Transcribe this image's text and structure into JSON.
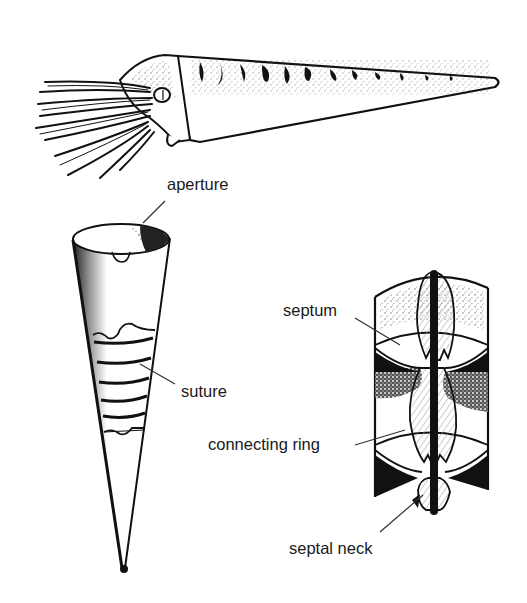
{
  "diagram": {
    "figures": [
      {
        "id": "living-animal",
        "description": "living animal with straight conical shell and tentacles"
      },
      {
        "id": "external-shell",
        "description": "external view of conical shell"
      },
      {
        "id": "shell-section",
        "description": "longitudinal section of shell chambers and siphuncle"
      }
    ],
    "labels": {
      "aperture": "aperture",
      "suture": "suture",
      "septum": "septum",
      "connecting_ring": "connecting ring",
      "septal_neck": "septal neck"
    },
    "colors": {
      "ink": "#111111",
      "paper": "#ffffff",
      "leader": "#333333"
    }
  }
}
